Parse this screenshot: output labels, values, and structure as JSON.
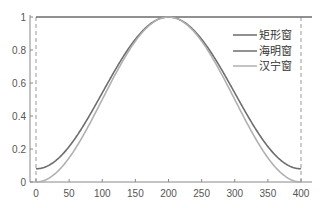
{
  "chart_data": {
    "type": "line",
    "title": "",
    "xlabel": "",
    "ylabel": "",
    "xlim": [
      0,
      400
    ],
    "ylim": [
      0,
      1
    ],
    "grid": false,
    "legend_position": "upper right",
    "x_ticks": [
      "0",
      "50",
      "100",
      "150",
      "200",
      "250",
      "300",
      "350",
      "400"
    ],
    "y_ticks": [
      "0",
      "0.2",
      "0.4",
      "0.6",
      "0.8",
      "1"
    ],
    "n_points": 401,
    "series": [
      {
        "name": "矩形窗",
        "formula": "rectangular",
        "color": "#6b6b6b",
        "values_at_ticks": [
          1,
          1,
          1,
          1,
          1,
          1,
          1,
          1,
          1
        ]
      },
      {
        "name": "海明窗",
        "formula": "hamming",
        "color": "#6e6e6e",
        "values_at_ticks": [
          0.08,
          0.22,
          0.54,
          0.86,
          1.0,
          0.86,
          0.54,
          0.22,
          0.08
        ]
      },
      {
        "name": "汉宁窗",
        "formula": "hanning",
        "color": "#b0b0b0",
        "values_at_ticks": [
          0.0,
          0.15,
          0.5,
          0.85,
          1.0,
          0.85,
          0.5,
          0.15,
          0.0
        ]
      }
    ]
  },
  "legend": {
    "items": [
      {
        "label": "矩形窗"
      },
      {
        "label": "海明窗"
      },
      {
        "label": "汉宁窗"
      }
    ]
  }
}
